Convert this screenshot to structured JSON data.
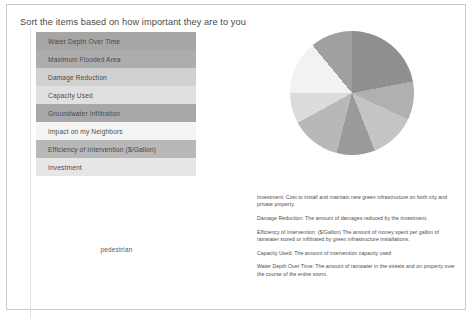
{
  "panel": {
    "title": "Sort the items based on how important they are to you",
    "items": [
      {
        "label": "Water Depth Over Time",
        "shade": "shade-dark",
        "color": "#a6a6a6"
      },
      {
        "label": "Maximum Flooded Area",
        "shade": "shade-dark",
        "color": "#adadad"
      },
      {
        "label": "Damage Reduction",
        "shade": "shade-light",
        "color": "#d0d0d0"
      },
      {
        "label": "Capacity Used",
        "shade": "shade-pale",
        "color": "#e0e0e0"
      },
      {
        "label": "Groundwater Infiltration",
        "shade": "shade-dark",
        "color": "#a8a8a8"
      },
      {
        "label": "Impact on my Neighbors",
        "shade": "shade-white",
        "color": "#f4f4f4"
      },
      {
        "label": "Efficiency of Intervention ($/Gallon)",
        "shade": "shade-mid",
        "color": "#b8b8b8"
      },
      {
        "label": "Investment",
        "shade": "shade-pale",
        "color": "#e6e6e6"
      }
    ]
  },
  "pedestrian_label": "pedestrian",
  "chart_data": {
    "type": "pie",
    "title": "",
    "legend_position": "none",
    "categories": [
      "Water Depth Over Time",
      "Maximum Flooded Area",
      "Damage Reduction",
      "Capacity Used",
      "Groundwater Infiltration",
      "Impact on my Neighbors",
      "Efficiency of Intervention ($/Gallon)",
      "Investment"
    ],
    "values": [
      22,
      10,
      12,
      10,
      13,
      8,
      14,
      11
    ],
    "colors": [
      "#8f8f8f",
      "#b0b0b0",
      "#c4c4c4",
      "#9a9a9a",
      "#b8b8b8",
      "#dcdcdc",
      "#f2f2f2",
      "#a0a0a0"
    ],
    "start_angle": 0,
    "labels_shown": false
  },
  "descriptions": [
    "Investment: Cost to install and maintain new green infrastructure on both city and private property.",
    "Damage Reduction: The amount of damages reduced by the investment.",
    "Efficiency of Intervention: ($/Gallon) The amount of money spent per gallon of rainwater stored or infiltrated by green infrastructure installations.",
    "Capacity Used: The amount of intervention capacity used",
    "Water Depth Over Time: The amount of rainwater in the streets and on property over the course of the entire storm."
  ]
}
